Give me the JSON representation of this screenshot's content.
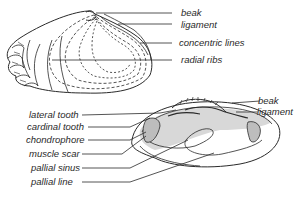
{
  "diagram": {
    "top_view": {
      "labels": [
        {
          "text": "beak"
        },
        {
          "text": "ligament"
        },
        {
          "text": "concentric lines"
        },
        {
          "text": "radial ribs"
        }
      ]
    },
    "inner_view": {
      "labels_right": [
        {
          "text": "beak"
        },
        {
          "text": "ligament"
        }
      ],
      "labels_left": [
        {
          "text": "lateral tooth"
        },
        {
          "text": "cardinal tooth"
        },
        {
          "text": "chondrophore"
        },
        {
          "text": "muscle scar"
        },
        {
          "text": "pallial sinus"
        },
        {
          "text": "pallial line"
        }
      ]
    },
    "colors": {
      "ink": "#2a2a2a",
      "background": "#ffffff",
      "stipple": "#9a9a9a"
    }
  }
}
